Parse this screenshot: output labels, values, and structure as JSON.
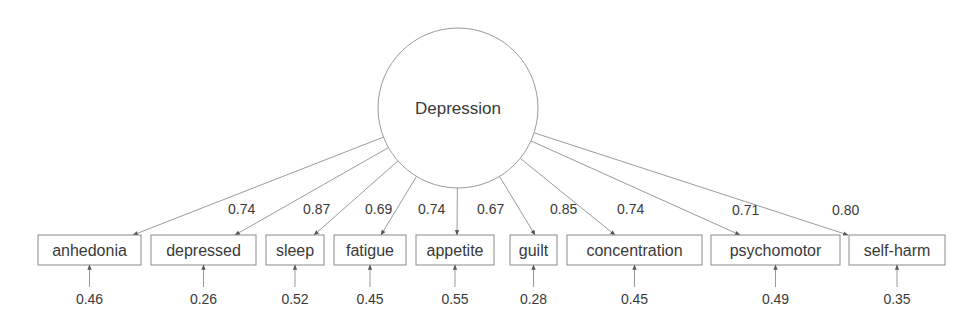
{
  "chart_data": {
    "type": "path-diagram",
    "title": "",
    "latent": {
      "label": "Depression",
      "cx": 458,
      "cy": 108,
      "r": 80
    },
    "indicators": [
      {
        "label": "anhedonia",
        "x": 38,
        "w": 103,
        "loading": "0.74",
        "error": "0.46",
        "tip": 133,
        "lx": 228,
        "ly": 214
      },
      {
        "label": "depressed",
        "x": 151,
        "w": 105,
        "loading": "0.87",
        "error": "0.26",
        "tip": 235,
        "lx": 303,
        "ly": 214
      },
      {
        "label": "sleep",
        "x": 266,
        "w": 58,
        "loading": "0.69",
        "error": "0.52",
        "tip": 314,
        "lx": 365,
        "ly": 214
      },
      {
        "label": "fatigue",
        "x": 334,
        "w": 72,
        "loading": "0.74",
        "error": "0.45",
        "tip": 381,
        "lx": 418,
        "ly": 214
      },
      {
        "label": "appetite",
        "x": 416,
        "w": 78,
        "loading": "0.67",
        "error": "0.55",
        "tip": 457,
        "lx": 477,
        "ly": 214
      },
      {
        "label": "guilt",
        "x": 510,
        "w": 47,
        "loading": "0.85",
        "error": "0.28",
        "tip": 535,
        "lx": 550,
        "ly": 214
      },
      {
        "label": "concentration",
        "x": 567,
        "w": 135,
        "loading": "0.74",
        "error": "0.45",
        "tip": 615,
        "lx": 617,
        "ly": 214
      },
      {
        "label": "psychomotor",
        "x": 711,
        "w": 129,
        "loading": "0.71",
        "error": "0.49",
        "tip": 740,
        "lx": 732,
        "ly": 215
      },
      {
        "label": "self-harm",
        "x": 849,
        "w": 96,
        "loading": "0.80",
        "error": "0.35",
        "tip": 848,
        "lx": 832,
        "ly": 215
      }
    ],
    "box_y": 235,
    "box_h": 30,
    "error_label_y": 304
  }
}
